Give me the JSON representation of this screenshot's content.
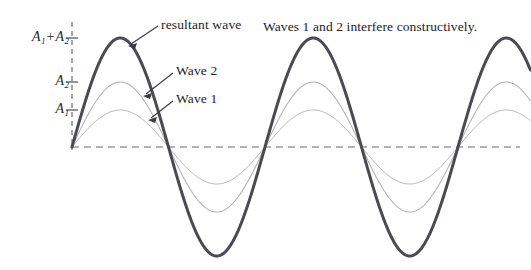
{
  "figure": {
    "caption": "Waves 1 and 2 interfere constructively.",
    "baseline_color": "#6b6b72",
    "axis_color": "#6b6b72",
    "resultant_color": "#4a4a52",
    "component_color": "#b4b4b8"
  },
  "axis": {
    "ticks": [
      {
        "label_a": "A",
        "sub_a": "1",
        "op": "+",
        "label_b": "A",
        "sub_b": "2",
        "name": "tick-a1-plus-a2"
      },
      {
        "label_a": "A",
        "sub_a": "2",
        "op": "",
        "label_b": "",
        "sub_b": "",
        "name": "tick-a2"
      },
      {
        "label_a": "A",
        "sub_a": "1",
        "op": "",
        "label_b": "",
        "sub_b": "",
        "name": "tick-a1"
      }
    ]
  },
  "callouts": {
    "resultant": "resultant wave",
    "wave2": "Wave 2",
    "wave1": "Wave 1"
  },
  "chart_data": {
    "type": "line",
    "title": "",
    "subtitle": "Waves 1 and 2 interfere constructively.",
    "xlabel": "",
    "ylabel": "",
    "grid": false,
    "legend": "inline-callouts",
    "x_origin_px": 72,
    "baseline_y_px": 147,
    "wavelength_px": 193,
    "x_range_px": [
      72,
      531
    ],
    "cycles_shown": 2.4,
    "phase": "all waves in phase (0 rad)",
    "amplitudes": {
      "wave1": 37,
      "wave2": 65,
      "resultant": 109
    },
    "tick_values_px": {
      "A1": 110,
      "A2": 82,
      "A1_plus_A2": 38
    },
    "series": [
      {
        "name": "Wave 1",
        "amplitude": 37,
        "color": "#b4b4b8",
        "width": 1.0,
        "peak_y_px": 110,
        "trough_y_px": 184
      },
      {
        "name": "Wave 2",
        "amplitude": 65,
        "color": "#b4b4b8",
        "width": 1.1,
        "peak_y_px": 82,
        "trough_y_px": 212
      },
      {
        "name": "resultant wave",
        "amplitude": 109,
        "color": "#4a4a52",
        "width": 3.0,
        "peak_y_px": 38,
        "trough_y_px": 256
      }
    ],
    "zero_crossings_px": [
      72,
      168,
      265,
      361,
      458
    ],
    "peaks_px": [
      120,
      313
    ],
    "troughs_px": [
      216,
      410
    ]
  }
}
